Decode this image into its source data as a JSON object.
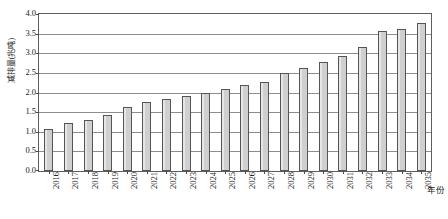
{
  "chart_data": {
    "type": "bar",
    "title": "",
    "subtitle": "",
    "xlabel": "年份",
    "ylabel": "减排量(兆吨)",
    "categories": [
      "2016",
      "2017",
      "2018",
      "2019",
      "2020",
      "2021",
      "2022",
      "2023",
      "2024",
      "2025",
      "2026",
      "2027",
      "2028",
      "2029",
      "2030",
      "2031",
      "2032",
      "2033",
      "2034",
      "2035"
    ],
    "values": [
      1.07,
      1.22,
      1.29,
      1.43,
      1.62,
      1.76,
      1.83,
      1.9,
      2.0,
      2.08,
      2.18,
      2.28,
      2.5,
      2.63,
      2.79,
      2.93,
      3.15,
      3.58,
      3.62,
      3.77
    ],
    "series": [
      {
        "name": "减排量",
        "values": [
          1.07,
          1.22,
          1.29,
          1.43,
          1.62,
          1.76,
          1.83,
          1.9,
          2.0,
          2.08,
          2.18,
          2.28,
          2.5,
          2.63,
          2.79,
          2.93,
          3.15,
          3.58,
          3.62,
          3.77
        ]
      }
    ],
    "ylim": [
      0.0,
      4.0
    ],
    "y_ticks": [
      "0.0",
      "0.5",
      "1.0",
      "1.5",
      "2.0",
      "2.5",
      "3.0",
      "3.5",
      "4.0"
    ],
    "y_tick_values": [
      0.0,
      0.5,
      1.0,
      1.5,
      2.0,
      2.5,
      3.0,
      3.5,
      4.0
    ],
    "grid": true,
    "grid_axis": "y",
    "legend": false,
    "legend_position": "none",
    "bar_fill_color": "#cfcfcf",
    "bar_border_color": "#555555",
    "gridline_color": "#8d8d8d",
    "plot_border_color": "#5d5d5d",
    "background_color": "#ffffff",
    "annotations": []
  }
}
